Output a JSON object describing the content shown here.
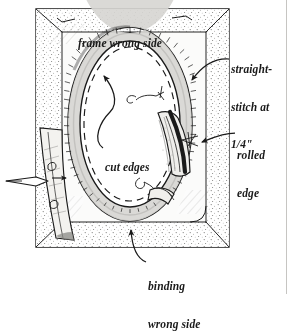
{
  "figure": {
    "kind": "hand-drawn sewing instruction illustration",
    "background_color": "#ffffff",
    "ink_color": "#1a1a1a",
    "fill_gray": "#e8e7e3",
    "stipple_gray": "#bdbcb8"
  },
  "labels": {
    "frame_wrong_side": "frame wrong side",
    "straight_stitch_line1": "straight-",
    "straight_stitch_line2": "stitch at",
    "straight_stitch_line3": "1/4\"",
    "rolled_edge_line1": "rolled",
    "rolled_edge_line2": "edge",
    "cut_edges": "cut edges",
    "binding_wrong_side_line1": "binding",
    "binding_wrong_side_line2": "wrong side"
  },
  "icons": {
    "leader_line": "leader-line",
    "arrowhead": "arrowhead",
    "fold_arrow": "fold-direction-arrow",
    "oval_opening": "oval-opening",
    "binding_band": "binding-band",
    "stitch_dashes": "stitch-dash-line",
    "page_rule": "page-edge-rule"
  }
}
